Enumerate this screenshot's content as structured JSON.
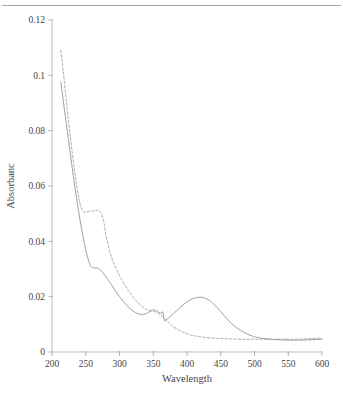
{
  "figure": {
    "top_rule": true,
    "background_color": "#ffffff"
  },
  "chart_data": {
    "type": "line",
    "title": "",
    "subtitle": "",
    "xlabel": "Wavelength",
    "ylabel": "Absorbanc",
    "xlim": [
      200,
      600
    ],
    "ylim": [
      0,
      0.12
    ],
    "xticks": [
      200,
      250,
      300,
      350,
      400,
      450,
      500,
      550,
      600
    ],
    "xtick_labels": [
      "200",
      "250",
      "300",
      "350",
      "400",
      "450",
      "500",
      "550",
      "600"
    ],
    "yticks": [
      0,
      0.02,
      0.04,
      0.06,
      0.08,
      0.1,
      0.12
    ],
    "ytick_labels": [
      "0",
      "0.02",
      "0.04",
      "0.06",
      "0.08",
      "0.1",
      "0.12"
    ],
    "grid": false,
    "legend": false,
    "legend_position": "none",
    "line_colors": {
      "solid": "#8e8e96",
      "dashed": "#9a9aa2"
    },
    "series": [
      {
        "name": "solid-spectrum",
        "style": "solid",
        "color": "#8e8e96",
        "x": [
          213,
          215,
          218,
          221,
          224,
          227,
          230,
          233,
          236,
          239,
          242,
          245,
          248,
          251,
          254,
          257,
          260,
          263,
          266,
          269,
          272,
          275,
          278,
          281,
          284,
          288,
          292,
          296,
          300,
          304,
          308,
          312,
          316,
          320,
          324,
          328,
          332,
          336,
          340,
          344,
          347,
          350,
          353,
          356,
          359,
          362,
          364,
          365,
          366,
          367,
          369,
          372,
          376,
          380,
          385,
          390,
          395,
          400,
          405,
          410,
          415,
          420,
          425,
          430,
          435,
          440,
          445,
          450,
          455,
          460,
          465,
          470,
          475,
          480,
          485,
          490,
          495,
          500,
          510,
          520,
          530,
          540,
          550,
          560,
          570,
          580,
          590,
          600
        ],
        "y": [
          0.0975,
          0.094,
          0.0885,
          0.083,
          0.0775,
          0.072,
          0.0665,
          0.0612,
          0.0562,
          0.0515,
          0.047,
          0.043,
          0.0392,
          0.0358,
          0.0332,
          0.0312,
          0.0305,
          0.0304,
          0.0304,
          0.0302,
          0.0296,
          0.0288,
          0.0278,
          0.0268,
          0.0258,
          0.0243,
          0.0228,
          0.0214,
          0.02,
          0.0188,
          0.0176,
          0.0166,
          0.0156,
          0.0148,
          0.0142,
          0.0138,
          0.0136,
          0.0136,
          0.0139,
          0.0145,
          0.015,
          0.0152,
          0.0151,
          0.0147,
          0.0143,
          0.014,
          0.0146,
          0.0134,
          0.012,
          0.0112,
          0.0116,
          0.0122,
          0.013,
          0.0139,
          0.015,
          0.0161,
          0.0172,
          0.0181,
          0.0189,
          0.0194,
          0.0197,
          0.0198,
          0.0196,
          0.0191,
          0.0183,
          0.0172,
          0.016,
          0.0146,
          0.0132,
          0.0118,
          0.0105,
          0.0094,
          0.0085,
          0.0077,
          0.007,
          0.0064,
          0.0059,
          0.0055,
          0.005,
          0.0047,
          0.0045,
          0.0044,
          0.0043,
          0.0043,
          0.0043,
          0.0044,
          0.0045,
          0.0046
        ]
      },
      {
        "name": "dashed-spectrum",
        "style": "dashed",
        "color": "#9a9aa2",
        "x": [
          213,
          216,
          219,
          222,
          225,
          228,
          231,
          234,
          237,
          240,
          243,
          246,
          249,
          252,
          255,
          258,
          261,
          264,
          267,
          270,
          272,
          274,
          276,
          278,
          280,
          283,
          286,
          289,
          292,
          296,
          300,
          304,
          308,
          312,
          316,
          320,
          324,
          328,
          332,
          336,
          340,
          344,
          348,
          352,
          356,
          360,
          364,
          368,
          372,
          376,
          380,
          385,
          390,
          395,
          400,
          405,
          410,
          415,
          420,
          430,
          440,
          450,
          460,
          470,
          480,
          490,
          500,
          510,
          520,
          530,
          540,
          550,
          560,
          570,
          580,
          590,
          600
        ],
        "y": [
          0.109,
          0.103,
          0.096,
          0.089,
          0.0825,
          0.076,
          0.07,
          0.0645,
          0.0595,
          0.0552,
          0.0522,
          0.0508,
          0.0506,
          0.0507,
          0.0508,
          0.0509,
          0.051,
          0.0511,
          0.0512,
          0.0511,
          0.0506,
          0.0496,
          0.0478,
          0.0452,
          0.0422,
          0.0388,
          0.036,
          0.0337,
          0.0318,
          0.0296,
          0.0276,
          0.0258,
          0.0241,
          0.0226,
          0.0212,
          0.0199,
          0.0187,
          0.0177,
          0.0168,
          0.016,
          0.0154,
          0.015,
          0.0148,
          0.0146,
          0.0142,
          0.0136,
          0.0128,
          0.0118,
          0.0108,
          0.0099,
          0.0091,
          0.0083,
          0.0076,
          0.0071,
          0.0066,
          0.0062,
          0.0059,
          0.0057,
          0.0055,
          0.0052,
          0.005,
          0.0049,
          0.0048,
          0.0047,
          0.0046,
          0.0046,
          0.0046,
          0.0046,
          0.0046,
          0.0046,
          0.0046,
          0.0046,
          0.0046,
          0.0047,
          0.0048,
          0.0049,
          0.005
        ]
      }
    ]
  }
}
